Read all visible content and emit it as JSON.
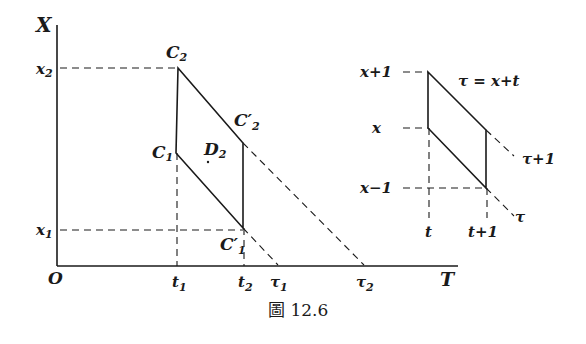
{
  "figure": {
    "caption": "圖 12.6",
    "caption_prefix": "圖",
    "caption_number": "12.6"
  },
  "left_diagram": {
    "axes": {
      "y_label": "X",
      "x_label": "T",
      "origin_label": "O"
    },
    "y_ticks": [
      {
        "label": "x",
        "sub": "2",
        "role": "x2"
      },
      {
        "label": "x",
        "sub": "1",
        "role": "x1"
      }
    ],
    "x_ticks": [
      {
        "label": "t",
        "sub": "1",
        "role": "t1"
      },
      {
        "label": "t",
        "sub": "2",
        "role": "t2"
      },
      {
        "label": "τ",
        "sub": "1",
        "role": "tau1"
      },
      {
        "label": "τ",
        "sub": "2",
        "role": "tau2"
      }
    ],
    "points": {
      "C2": {
        "label": "C",
        "sub": "2"
      },
      "C1": {
        "label": "C",
        "sub": "1"
      },
      "C2p": {
        "label": "C′",
        "sub": "2"
      },
      "C1p": {
        "label": "C′",
        "sub": "1"
      }
    },
    "region": {
      "label": "D",
      "sub": "2"
    }
  },
  "right_diagram": {
    "y_labels": [
      "x+1",
      "x",
      "x−1"
    ],
    "x_labels": [
      "t",
      "t+1"
    ],
    "equation": "τ = x+t",
    "line_labels": [
      "τ+1",
      "τ"
    ]
  }
}
